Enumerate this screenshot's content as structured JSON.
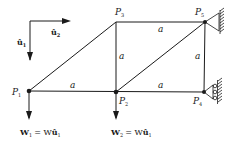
{
  "diagram": {
    "type": "truss",
    "nodes": [
      {
        "id": "P1",
        "label": "P",
        "sub": "1",
        "x": 29,
        "y": 91
      },
      {
        "id": "P2",
        "label": "P",
        "sub": "2",
        "x": 116,
        "y": 92
      },
      {
        "id": "P3",
        "label": "P",
        "sub": "3",
        "x": 116,
        "y": 22
      },
      {
        "id": "P4",
        "label": "P",
        "sub": "4",
        "x": 204,
        "y": 92
      },
      {
        "id": "P5",
        "label": "P",
        "sub": "5",
        "x": 205,
        "y": 22
      }
    ],
    "members": [
      {
        "from": "P1",
        "to": "P2",
        "length_label": "a"
      },
      {
        "from": "P2",
        "to": "P4",
        "length_label": "a"
      },
      {
        "from": "P3",
        "to": "P5",
        "length_label": "a"
      },
      {
        "from": "P2",
        "to": "P3",
        "length_label": "a"
      },
      {
        "from": "P4",
        "to": "P5",
        "length_label": "a"
      },
      {
        "from": "P1",
        "to": "P3",
        "length_label": ""
      },
      {
        "from": "P2",
        "to": "P5",
        "length_label": ""
      }
    ],
    "supports": [
      {
        "node": "P5",
        "type": "pin"
      },
      {
        "node": "P4",
        "type": "roller"
      }
    ],
    "unit_vectors": {
      "u1": {
        "label": "û",
        "sub": "1",
        "direction": "down"
      },
      "u2": {
        "label": "û",
        "sub": "2",
        "direction": "right"
      }
    },
    "loads": [
      {
        "node": "P1",
        "vector": "W",
        "sub": "1",
        "equals": "= W",
        "unit": "û",
        "unit_sub": "1"
      },
      {
        "node": "P2",
        "vector": "W",
        "sub": "2",
        "equals": "= W",
        "unit": "û",
        "unit_sub": "1"
      }
    ],
    "length_symbol": "a"
  }
}
